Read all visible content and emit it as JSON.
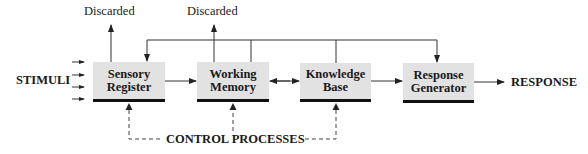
{
  "diagram": {
    "input_label": "STIMULI",
    "output_label": "RESPONSE",
    "control_label": "CONTROL PROCESSES",
    "discarded_labels": [
      "Discarded",
      "Discarded"
    ],
    "boxes": [
      {
        "line1": "Sensory",
        "line2": "Register"
      },
      {
        "line1": "Working",
        "line2": "Memory"
      },
      {
        "line1": "Knowledge",
        "line2": "Base"
      },
      {
        "line1": "Response",
        "line2": "Generator"
      }
    ],
    "colors": {
      "box_fill": "#e2e2e2",
      "box_shadow": "#111111",
      "line": "#333333",
      "text": "#1a1a1a"
    }
  }
}
